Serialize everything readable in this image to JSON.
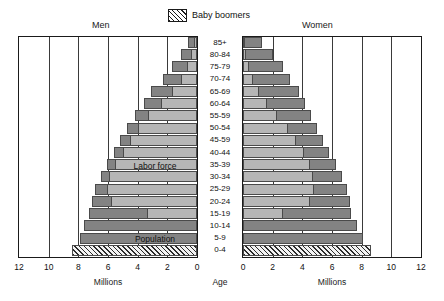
{
  "legend": {
    "swatch_name": "hatched-swatch",
    "label": "Baby boomers"
  },
  "panels": {
    "left_title": "Men",
    "right_title": "Women"
  },
  "axis": {
    "center_label": "Age",
    "left_unit": "Millions",
    "right_unit": "Millions",
    "left_ticks": [
      "12",
      "10",
      "8",
      "6",
      "4",
      "2",
      "0"
    ],
    "right_ticks": [
      "0",
      "2",
      "4",
      "6",
      "8",
      "10",
      "12"
    ]
  },
  "annotations": [
    {
      "text": "Labor force",
      "age_group": "35-39",
      "side": "men"
    },
    {
      "text": "Population",
      "age_group": "5-9",
      "side": "men"
    }
  ],
  "chart_data": {
    "type": "bar",
    "subtype": "population-pyramid",
    "title": "",
    "xlabel": "Millions",
    "ylabel": "Age",
    "xlim": [
      0,
      12
    ],
    "grid": true,
    "legend_position": "top-center",
    "categories": [
      "85+",
      "80-84",
      "75-79",
      "70-74",
      "65-69",
      "60-64",
      "55-59",
      "50-54",
      "45-59",
      "40-44",
      "35-39",
      "30-34",
      "25-29",
      "20-24",
      "15-19",
      "10-14",
      "5-9",
      "0-4"
    ],
    "series": [
      {
        "name": "Men total population",
        "side": "left",
        "color": "#838383",
        "values": [
          0.6,
          1.1,
          1.7,
          2.3,
          3.1,
          3.6,
          4.2,
          4.7,
          5.2,
          5.6,
          6.1,
          6.5,
          6.9,
          7.1,
          7.3,
          7.6,
          7.9,
          8.4
        ]
      },
      {
        "name": "Men labor force",
        "side": "left",
        "color": "#b6b6b6",
        "values": [
          0.2,
          0.4,
          0.7,
          1.1,
          1.7,
          2.4,
          3.3,
          4.0,
          4.5,
          5.0,
          5.5,
          5.9,
          6.1,
          5.8,
          3.4,
          0.0,
          0.0,
          0.0
        ]
      },
      {
        "name": "Women total population",
        "side": "right",
        "color": "#838383",
        "values": [
          1.3,
          2.0,
          2.7,
          3.2,
          3.8,
          4.2,
          4.6,
          5.0,
          5.4,
          5.8,
          6.3,
          6.7,
          7.0,
          7.2,
          7.3,
          7.7,
          8.1,
          8.6
        ]
      },
      {
        "name": "Women labor force",
        "side": "right",
        "color": "#b6b6b6",
        "values": [
          0.1,
          0.2,
          0.4,
          0.7,
          1.1,
          1.6,
          2.3,
          3.0,
          3.6,
          4.1,
          4.5,
          4.7,
          4.8,
          4.5,
          2.7,
          0.0,
          0.0,
          0.0
        ]
      }
    ],
    "baby_boomer_groups": [
      "0-4"
    ],
    "annotation_labels": [
      "Labor force",
      "Population"
    ]
  }
}
